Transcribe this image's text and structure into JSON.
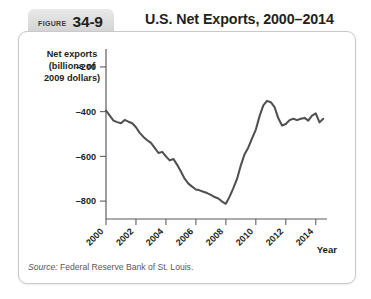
{
  "figure": {
    "tag_word": "Figure",
    "tag_number": "34-9",
    "title": "U.S. Net Exports, 2000–2014"
  },
  "source": {
    "label": "Source:",
    "text": "Federal Reserve Bank of St. Louis."
  },
  "colors": {
    "line": "#4f5052",
    "axis": "#58595b",
    "tag_background": "#dcdcdc",
    "panel_border": "#c9c9c9",
    "text": "#231f20"
  },
  "chart_data": {
    "type": "line",
    "title": "U.S. Net Exports, 2000–2014",
    "ylabel": "Net exports (billions of 2009 dollars)",
    "ylabel_lines": [
      "Net exports",
      "(billions of",
      "2009 dollars)"
    ],
    "xlabel": "Year",
    "grid": false,
    "legend": "none",
    "xlim": [
      2000,
      2014.75
    ],
    "ylim": [
      -880,
      -120
    ],
    "ytick_values": [
      -200,
      -400,
      -600,
      -800
    ],
    "ytick_labels": [
      "–200",
      "–400",
      "–600",
      "–800"
    ],
    "xtick_values": [
      2000,
      2002,
      2004,
      2006,
      2008,
      2010,
      2012,
      2014
    ],
    "xtick_labels": [
      "2000",
      "2002",
      "2004",
      "2006",
      "2008",
      "2010",
      "2012",
      "2014"
    ],
    "series": [
      {
        "name": "Net exports",
        "units": "billions of 2009 dollars",
        "x": [
          2000.0,
          2000.25,
          2000.5,
          2000.75,
          2001.0,
          2001.25,
          2001.5,
          2001.75,
          2002.0,
          2002.25,
          2002.5,
          2002.75,
          2003.0,
          2003.25,
          2003.5,
          2003.75,
          2004.0,
          2004.25,
          2004.5,
          2004.75,
          2005.0,
          2005.25,
          2005.5,
          2005.75,
          2006.0,
          2006.25,
          2006.5,
          2006.75,
          2007.0,
          2007.25,
          2007.5,
          2007.75,
          2008.0,
          2008.25,
          2008.5,
          2008.75,
          2009.0,
          2009.25,
          2009.5,
          2009.75,
          2010.0,
          2010.25,
          2010.5,
          2010.75,
          2011.0,
          2011.25,
          2011.5,
          2011.75,
          2012.0,
          2012.25,
          2012.5,
          2012.75,
          2013.0,
          2013.25,
          2013.5,
          2013.75,
          2014.0,
          2014.25,
          2014.5
        ],
        "values": [
          -395,
          -418,
          -440,
          -447,
          -452,
          -437,
          -445,
          -452,
          -470,
          -495,
          -513,
          -528,
          -540,
          -562,
          -585,
          -580,
          -600,
          -618,
          -612,
          -638,
          -668,
          -700,
          -722,
          -735,
          -748,
          -752,
          -758,
          -764,
          -772,
          -782,
          -788,
          -802,
          -812,
          -780,
          -742,
          -700,
          -640,
          -590,
          -560,
          -520,
          -480,
          -420,
          -372,
          -352,
          -358,
          -380,
          -430,
          -462,
          -455,
          -438,
          -432,
          -438,
          -432,
          -428,
          -440,
          -418,
          -408,
          -448,
          -432
        ]
      }
    ],
    "annotations": []
  }
}
